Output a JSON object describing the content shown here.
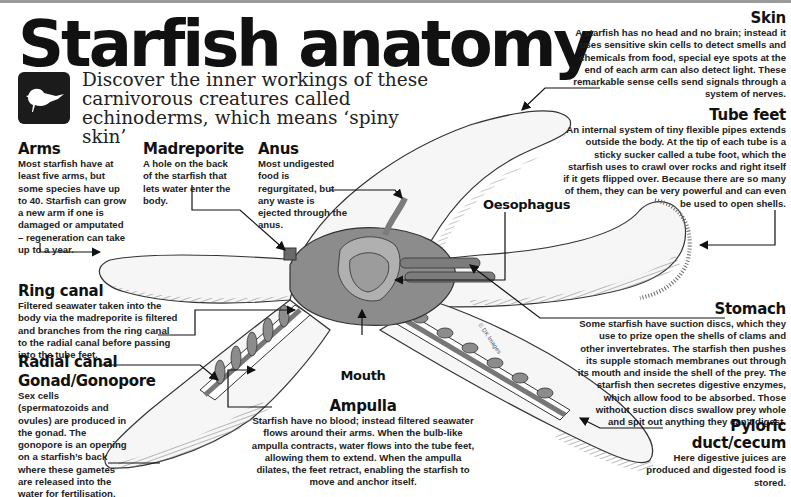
{
  "header": {
    "title": "Starfish anatomy",
    "subtitle": "Discover the inner workings of these carnivorous creatures called echinoderms, which means ‘spiny skin’",
    "icon": "bird-icon"
  },
  "labels": {
    "skin": {
      "title": "Skin",
      "text": "A starfish has no head and no brain; instead it uses sensitive skin cells to detect smells and chemicals from food, special eye spots at the end of each arm can also detect light. These remarkable sense cells send signals through a system of nerves."
    },
    "tube_feet": {
      "title": "Tube feet",
      "text": "An internal system of tiny flexible pipes extends outside the body. At the tip of each tube is a sticky sucker called a tube foot, which the starfish uses to crawl over rocks and right itself if it gets flipped over. Because there are so many of them, they can be very powerful and can even be used to open shells."
    },
    "arms": {
      "title": "Arms",
      "text": "Most starfish have at least five arms, but some species have up to 40. Starfish can grow a new arm if one is damaged or amputated – regeneration can take up to a year."
    },
    "madreporite": {
      "title": "Madreporite",
      "text": "A hole on the back of the starfish that lets water enter the body."
    },
    "anus": {
      "title": "Anus",
      "text": "Most undigested food is regurgitated, but any waste is ejected through the anus."
    },
    "oesophagus": {
      "title": "Oesophagus"
    },
    "ring_canal": {
      "title": "Ring canal",
      "text": "Filtered seawater taken into the body via the madreporite is filtered and branches from the ring canal to the radial canal before passing into the tube feet."
    },
    "radial_canal": {
      "title": "Radial canal"
    },
    "gonad": {
      "title": "Gonad/Gonopore",
      "text": "Sex cells (spermatozoids and ovules) are produced in the gonad. The gonopore is an opening on a starfish’s back where these gametes are released into the water for fertilisation."
    },
    "mouth": {
      "title": "Mouth"
    },
    "ampulla": {
      "title": "Ampulla",
      "text": "Starfish have no blood; instead filtered seawater flows around their arms. When the bulb-like ampulla contracts, water flows into the tube feet, allowing them to extend. When the ampulla dilates, the feet retract, enabling the starfish to move and anchor itself."
    },
    "stomach": {
      "title": "Stomach",
      "text": "Some starfish have suction discs, which they use to prize open the shells of clams and other invertebrates. The starfish then pushes its supple stomach membranes out through its mouth and inside the shell of the prey. The starfish then secretes digestive enzymes, which allow food to be absorbed. Those without suction discs swallow prey whole and spit out anything they can’t digest."
    },
    "pyloric": {
      "title": "Pyloric duct/cecum",
      "text": "Here digestive juices are produced and digested food is stored."
    }
  },
  "credit": "© DK Images",
  "colors": {
    "text": "#1a1a1a",
    "body_fill": "#f4f4f4",
    "organ_fill": "#8c8c8c",
    "organ_dark": "#5e5e5e",
    "line": "#222222"
  }
}
